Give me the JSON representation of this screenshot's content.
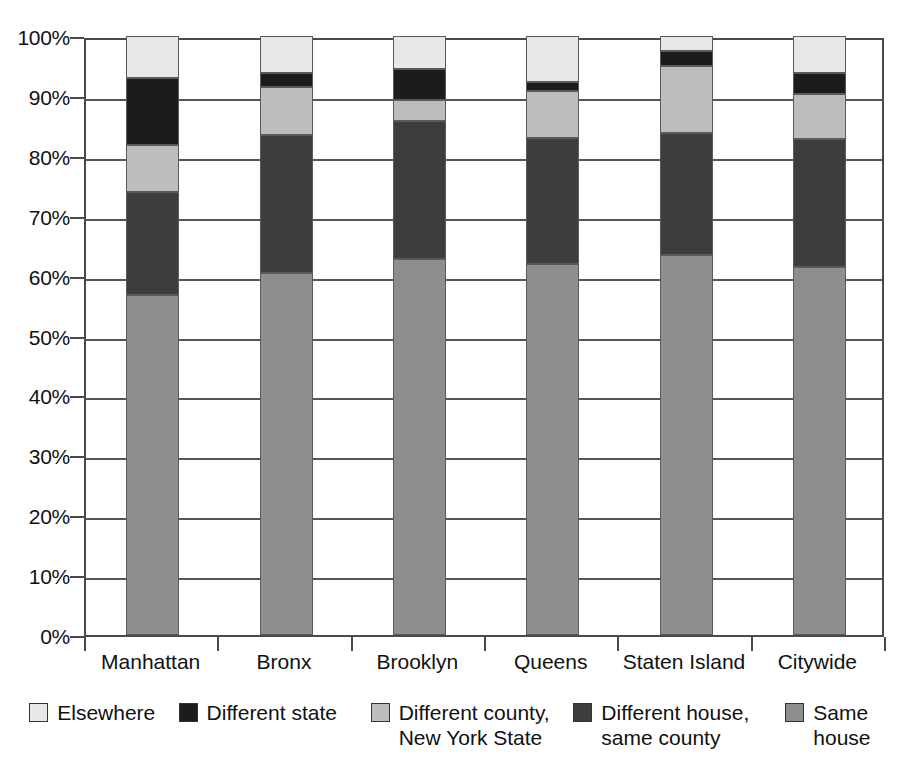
{
  "chart_data": {
    "type": "bar",
    "subtype": "stacked-bar-100-percent",
    "title": "",
    "subtitle": "",
    "xlabel": "",
    "ylabel": "",
    "ylim": [
      0,
      100
    ],
    "ytick_labels": [
      "0%",
      "10%",
      "20%",
      "30%",
      "40%",
      "50%",
      "60%",
      "70%",
      "80%",
      "90%",
      "100%"
    ],
    "ytick_values": [
      0,
      10,
      20,
      30,
      40,
      50,
      60,
      70,
      80,
      90,
      100
    ],
    "grid": true,
    "grid_axis": "y",
    "legend_position": "bottom",
    "stack_order_bottom_to_top": [
      "Same house",
      "Different house, same county",
      "Different county, New York State",
      "Different state",
      "Elsewhere"
    ],
    "categories": [
      "Manhattan",
      "Bronx",
      "Brooklyn",
      "Queens",
      "Staten Island",
      "Citywide"
    ],
    "series": [
      {
        "name": "Same house",
        "color": "#8e8e8e",
        "values": [
          56.8,
          60.5,
          62.8,
          62.0,
          63.5,
          61.5
        ]
      },
      {
        "name": "Different house, same county",
        "color": "#3d3d3d",
        "values": [
          17.2,
          23.0,
          23.0,
          21.0,
          20.3,
          21.3
        ]
      },
      {
        "name": "Different county, New York State",
        "color": "#bdbdbd",
        "values": [
          7.8,
          8.0,
          3.5,
          7.8,
          11.2,
          7.5
        ]
      },
      {
        "name": "Different state",
        "color": "#1c1c1c",
        "values": [
          11.2,
          2.3,
          5.2,
          1.5,
          2.5,
          3.5
        ]
      },
      {
        "name": "Elsewhere",
        "color": "#e7e7e7",
        "values": [
          7.0,
          6.2,
          5.5,
          7.7,
          2.5,
          6.2
        ]
      }
    ],
    "cumulative_tops": {
      "Manhattan": [
        56.8,
        74.0,
        81.8,
        93.0,
        100.0
      ],
      "Bronx": [
        60.5,
        83.5,
        91.5,
        93.8,
        100.0
      ],
      "Brooklyn": [
        62.8,
        85.8,
        89.3,
        94.5,
        100.0
      ],
      "Queens": [
        62.0,
        83.0,
        90.8,
        92.3,
        100.0
      ],
      "Staten Island": [
        63.5,
        83.8,
        95.0,
        97.5,
        100.0
      ],
      "Citywide": [
        61.5,
        82.8,
        90.3,
        93.8,
        100.0
      ]
    }
  },
  "legend": {
    "items": [
      {
        "label": "Elsewhere",
        "color": "#e7e7e7"
      },
      {
        "label": "Different state",
        "color": "#1c1c1c"
      },
      {
        "label": "Different county,\nNew York State",
        "color": "#bdbdbd"
      },
      {
        "label": "Different house,\nsame county",
        "color": "#3d3d3d"
      },
      {
        "label": "Same house",
        "color": "#8e8e8e"
      }
    ]
  }
}
